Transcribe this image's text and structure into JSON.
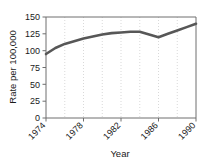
{
  "chart_data": {
    "type": "line",
    "title": "",
    "xlabel": "Year",
    "ylabel": "Rate per 100,000",
    "xlim": [
      1974,
      1990
    ],
    "ylim": [
      0,
      150
    ],
    "grid": "vertical-dotted",
    "legend": "none",
    "x": [
      1974,
      1975,
      1976,
      1977,
      1978,
      1979,
      1980,
      1981,
      1982,
      1983,
      1984,
      1985,
      1986,
      1987,
      1988,
      1989,
      1990
    ],
    "values": [
      95,
      104,
      110,
      114,
      118,
      121,
      124,
      126,
      127,
      128,
      128,
      124,
      120,
      125,
      130,
      135,
      140
    ],
    "series": [
      {
        "name": "Rate per 100,000",
        "color": "#575757",
        "values": [
          95,
          104,
          110,
          114,
          118,
          121,
          124,
          126,
          127,
          128,
          128,
          124,
          120,
          125,
          130,
          135,
          140
        ]
      }
    ],
    "x_tick_labels": [
      "1974",
      "1978",
      "1982",
      "1986",
      "1990"
    ],
    "x_tick_values": [
      1974,
      1978,
      1982,
      1986,
      1990
    ],
    "y_tick_labels": [
      "0",
      "25",
      "50",
      "75",
      "100",
      "125",
      "150"
    ],
    "y_tick_values": [
      0,
      25,
      50,
      75,
      100,
      125,
      150
    ],
    "gridline_x_values": [
      1976,
      1978,
      1980,
      1982,
      1984,
      1986,
      1988
    ],
    "axis_color": "#6f6f6f",
    "grid_color": "#c8c8c8",
    "background": "#ffffff"
  },
  "labels": {
    "y_axis_title": "Rate per 100,000",
    "x_axis_title": "Year",
    "ytick_0": "0",
    "ytick_25": "25",
    "ytick_50": "50",
    "ytick_75": "75",
    "ytick_100": "100",
    "ytick_125": "125",
    "ytick_150": "150",
    "xtick_1974": "1974",
    "xtick_1978": "1978",
    "xtick_1982": "1982",
    "xtick_1986": "1986",
    "xtick_1990": "1990"
  }
}
